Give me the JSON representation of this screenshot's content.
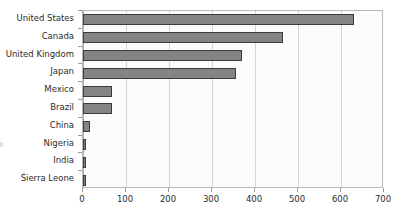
{
  "chart_data": {
    "type": "bar",
    "orientation": "horizontal",
    "title": "",
    "subtitle": "",
    "xlabel": "",
    "ylabel": "",
    "categories": [
      "United States",
      "Canada",
      "United Kingdom",
      "Japan",
      "Mexico",
      "Brazil",
      "China",
      "Nigeria",
      "India",
      "Sierra Leone"
    ],
    "values": [
      630,
      465,
      370,
      356,
      68,
      67,
      17,
      8,
      7,
      6
    ],
    "xlim": [
      0,
      700
    ],
    "xticks": [
      0,
      100,
      200,
      300,
      400,
      500,
      600,
      700
    ],
    "xticklabels": [
      "0",
      "100",
      "200",
      "300",
      "400",
      "500",
      "600",
      "700"
    ],
    "grid": true,
    "grid_axis": "x",
    "legend": false,
    "bar_fill": "#848484",
    "bar_edge": "#3b3b3b",
    "plot_background": "#fcfcfc",
    "plot_border": "#b9b9b9",
    "gridline_color": "#d4d4d4",
    "axis_color": "#9a9a9a",
    "text_color": "#2b2b2b"
  }
}
